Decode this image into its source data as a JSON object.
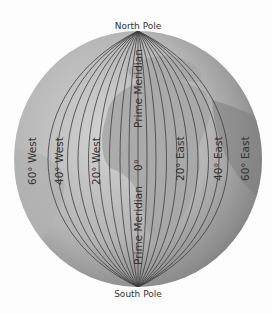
{
  "diagram": {
    "top_label": "North Pole",
    "bottom_label": "South Pole",
    "prime_meridian": {
      "upper_label": "Prime Meridian",
      "lower_label": "Prime Meridian",
      "degree_label": "0°"
    },
    "meridian_labels": [
      {
        "id": "w60",
        "text": "60° West"
      },
      {
        "id": "w40",
        "text": "40° West"
      },
      {
        "id": "w20",
        "text": "20° West"
      },
      {
        "id": "e20",
        "text": "20° East"
      },
      {
        "id": "e40",
        "text": "40° East"
      },
      {
        "id": "e60",
        "text": "60° East"
      }
    ],
    "colors": {
      "background": "#fdfdfd",
      "globe_light": "#c9c9c9",
      "globe_dark": "#6a6a6a",
      "land": "#a9a9a9",
      "meridian_line": "#3c3c3c",
      "text": "#333333"
    }
  }
}
